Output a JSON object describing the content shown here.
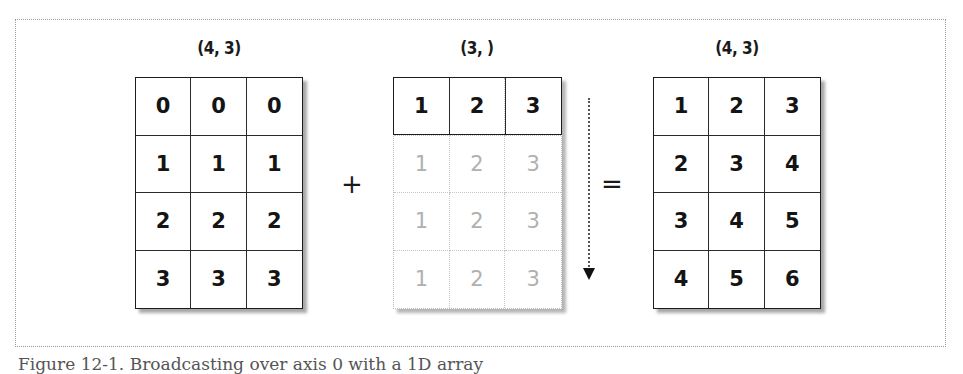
{
  "figure": {
    "caption": "Figure 12-1. Broadcasting over axis 0 with a 1D array"
  },
  "left": {
    "shape_label": "(4, 3)",
    "rows": [
      [
        "0",
        "0",
        "0"
      ],
      [
        "1",
        "1",
        "1"
      ],
      [
        "2",
        "2",
        "2"
      ],
      [
        "3",
        "3",
        "3"
      ]
    ]
  },
  "operator_plus": "+",
  "middle": {
    "shape_label": "(3, )",
    "rows": [
      [
        "1",
        "2",
        "3"
      ],
      [
        "1",
        "2",
        "3"
      ],
      [
        "1",
        "2",
        "3"
      ],
      [
        "1",
        "2",
        "3"
      ]
    ],
    "broadcast_note": "first row is the actual array; rows below are faded broadcast copies"
  },
  "operator_equals": "=",
  "right": {
    "shape_label": "(4, 3)",
    "rows": [
      [
        "1",
        "2",
        "3"
      ],
      [
        "2",
        "3",
        "4"
      ],
      [
        "3",
        "4",
        "5"
      ],
      [
        "4",
        "5",
        "6"
      ]
    ]
  },
  "icons": {
    "arrow": "dotted-down-arrow"
  }
}
